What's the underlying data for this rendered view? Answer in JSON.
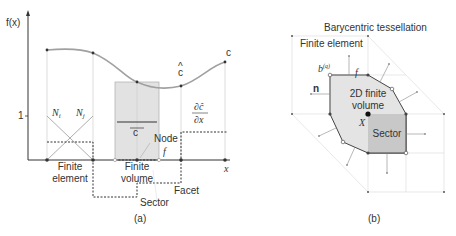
{
  "panel_a": {
    "y_axis_label": "f(x)",
    "x_axis_label": "x",
    "y_tick_one": "1",
    "shape_fn_i": "N",
    "shape_fn_i_sub": "i",
    "shape_fn_j": "N",
    "shape_fn_j_sub": "j",
    "c_bar": "c",
    "c_hat": "c",
    "c_label": "c",
    "deriv_num": "∂ĉ",
    "deriv_den": "∂x",
    "node_label": "Node",
    "facet_symbol": "f",
    "finite_element_line1": "Finite",
    "finite_element_line2": "element",
    "finite_volume_line1": "Finite",
    "finite_volume_line2": "volume",
    "facet_label": "Facet",
    "sector_label": "Sector",
    "caption": "(a)"
  },
  "panel_b": {
    "title": "Barycentric tessellation",
    "finite_element_label": "Finite element",
    "b_label": "b",
    "b_sup": "(q)",
    "f_label": "f",
    "n_label": "n",
    "volume_line1": "2D finite",
    "volume_line2": "volume",
    "x_label": "X",
    "sector_label": "Sector",
    "caption": "(b)"
  },
  "colors": {
    "axis": "#333333",
    "curve": "#a0a0a0",
    "fill_volume": "#e2e2e2",
    "fill_sector": "#c8c8c8",
    "grid": "#d0d0d0",
    "dashed": "#333333"
  }
}
